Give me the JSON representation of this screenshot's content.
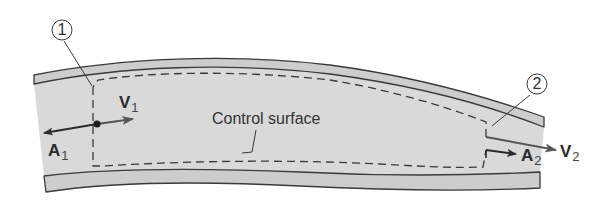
{
  "figure": {
    "colors": {
      "background": "#ffffff",
      "fluid": "#d9d9d9",
      "pipe_wall": "#cfcfcf",
      "outline": "#3a3a3a",
      "arrow": "#2b2b2b",
      "arrow_v2": "#555555"
    }
  },
  "labels": {
    "station_1": "1",
    "station_2": "2",
    "control_surface": "Control surface",
    "v1": {
      "symbol": "V",
      "sub": "1"
    },
    "a1": {
      "symbol": "A",
      "sub": "1"
    },
    "v2": {
      "symbol": "V",
      "sub": "2"
    },
    "a2": {
      "symbol": "A",
      "sub": "2"
    }
  },
  "elements": {
    "inlet": "Section 1 (inlet) with velocity V1 and outward area vector A1",
    "outlet": "Section 2 (outlet) with velocity V2 and outward area vector A2",
    "control_surface": "Dashed control surface enclosing fluid between sections 1 and 2"
  }
}
